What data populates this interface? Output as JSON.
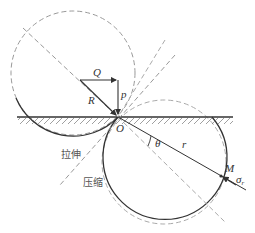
{
  "diagram": {
    "labels": {
      "Q": "Q",
      "P": "p",
      "R": "R",
      "O": "O",
      "theta": "θ",
      "r": "r",
      "M": "M",
      "sigma": "σ",
      "sigma_sub": "r",
      "tension": "拉伸",
      "compression": "压缩"
    },
    "colors": {
      "line": "#333333",
      "dashed": "#999999"
    }
  }
}
